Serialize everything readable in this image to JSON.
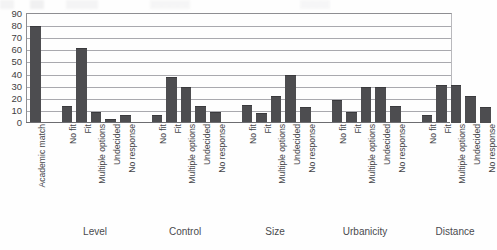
{
  "chart_data": {
    "type": "bar",
    "title": "",
    "xlabel": "",
    "ylabel": "",
    "ylim": [
      0,
      90
    ],
    "ytick_labels": [
      "90",
      "80",
      "70",
      "60",
      "50",
      "40",
      "30",
      "20",
      "10",
      "0"
    ],
    "ytick_values": [
      90,
      80,
      70,
      60,
      50,
      40,
      30,
      20,
      10,
      0
    ],
    "grid": true,
    "grid_axis": "y",
    "legend": "none",
    "bar_color": "#4d4d50",
    "categories": [
      "Academic match",
      "No fit",
      "Fit",
      "Multiple options",
      "Undecided",
      "No response",
      "No fit",
      "Fit",
      "Multiple options",
      "Undecided",
      "No response",
      "No fit",
      "Fit",
      "Multiple options",
      "Undecided",
      "No response",
      "No fit",
      "Fit",
      "Multiple options",
      "Undecided",
      "No response",
      "No fit",
      "Fit",
      "Multiple options",
      "Undecided",
      "No response"
    ],
    "values": [
      80,
      14,
      62,
      9,
      3,
      7,
      7,
      38,
      30,
      14,
      9,
      15,
      8,
      22,
      40,
      13,
      19,
      9,
      30,
      30,
      14,
      7,
      31,
      31,
      22,
      13
    ],
    "groups": [
      {
        "label": "",
        "categories": [
          "Academic match"
        ],
        "values": [
          80
        ]
      },
      {
        "label": "Level",
        "categories": [
          "No fit",
          "Fit",
          "Multiple options",
          "Undecided",
          "No response"
        ],
        "values": [
          14,
          62,
          9,
          3,
          7
        ]
      },
      {
        "label": "Control",
        "categories": [
          "No fit",
          "Fit",
          "Multiple options",
          "Undecided",
          "No response"
        ],
        "values": [
          7,
          38,
          30,
          14,
          9
        ]
      },
      {
        "label": "Size",
        "categories": [
          "No fit",
          "Fit",
          "Multiple options",
          "Undecided",
          "No response"
        ],
        "values": [
          15,
          8,
          22,
          40,
          13
        ]
      },
      {
        "label": "Urbanicity",
        "categories": [
          "No fit",
          "Fit",
          "Multiple options",
          "Undecided",
          "No response"
        ],
        "values": [
          19,
          9,
          30,
          30,
          14
        ]
      },
      {
        "label": "Distance",
        "categories": [
          "No fit",
          "Fit",
          "Multiple options",
          "Undecided",
          "No response"
        ],
        "values": [
          7,
          31,
          31,
          22,
          13
        ]
      }
    ],
    "group_labels": [
      "Level",
      "Control",
      "Size",
      "Urbanicity",
      "Distance"
    ]
  }
}
